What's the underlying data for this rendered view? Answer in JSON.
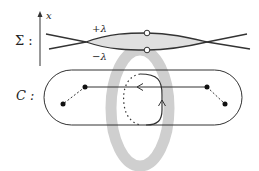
{
  "diagram": {
    "sigma_label": "Σ :",
    "c_label": "C :",
    "axis_label": "x",
    "plus_lambda": "+λ",
    "minus_lambda": "−λ",
    "colors": {
      "line": "#333333",
      "ring": "#cccccc",
      "lens_fill": "#dddddd",
      "background": "#ffffff"
    },
    "sheets": {
      "crossings_x": [
        86,
        207
      ],
      "upper_y": 33,
      "lower_y": 50
    },
    "curve_C": {
      "shape": "stadium",
      "branch_points": [
        [
          63,
          104
        ],
        [
          85,
          87
        ],
        [
          207,
          87
        ],
        [
          225,
          104
        ]
      ],
      "cuts": [
        "dashed",
        "dashed"
      ]
    }
  }
}
